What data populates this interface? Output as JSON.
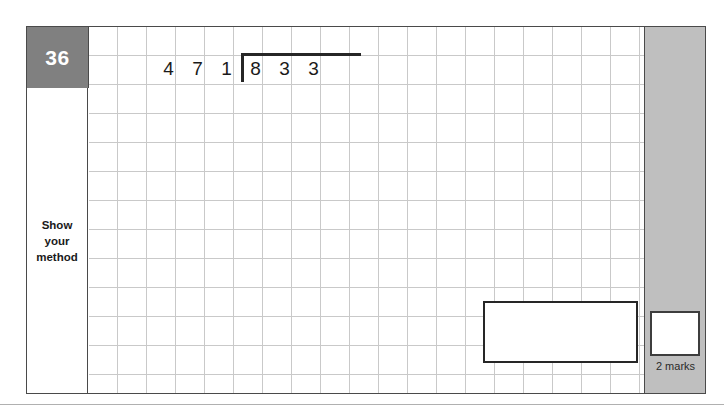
{
  "question": {
    "number": "36",
    "instruction_lines": [
      "Show",
      "your",
      "method"
    ],
    "division": {
      "divisor_digits": [
        "4",
        "7"
      ],
      "dividend_digits": [
        "1",
        "8",
        "3",
        "3"
      ],
      "expression": "1833 ÷ 47"
    },
    "marks": {
      "label": "2 marks",
      "value": 2
    }
  },
  "colors": {
    "number_badge_bg": "#808080",
    "number_badge_text": "#ffffff",
    "sidebar_bg": "#bfbfbf",
    "grid_line": "#c9c9c9",
    "frame_border": "#4a4a4a",
    "ink": "#262626"
  }
}
